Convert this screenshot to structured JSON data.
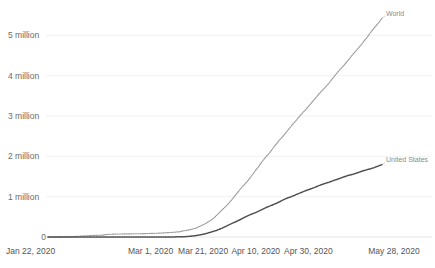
{
  "chart_data": {
    "type": "line",
    "title": "",
    "subtitle": "",
    "xlabel": "",
    "ylabel": "",
    "grid": true,
    "legend_position": "inline-end-of-line",
    "ylim": [
      0,
      5500000
    ],
    "yticks": [
      0,
      1000000,
      2000000,
      3000000,
      4000000,
      5000000
    ],
    "ytick_labels": [
      "0",
      "1 million",
      "2 million",
      "3 million",
      "4 million",
      "5 million"
    ],
    "xlim": [
      "Jan 22, 2020",
      "May 28, 2020"
    ],
    "xtick_labels": [
      "Jan 22, 2020",
      "Mar 1, 2020",
      "Mar 21, 2020",
      "Apr 10, 2020",
      "Apr 30, 2020",
      "May 28, 2020"
    ],
    "xtick_day_index": [
      0,
      39,
      59,
      79,
      99,
      127
    ],
    "x_day_count": 128,
    "series": [
      {
        "name": "World",
        "label": "World",
        "color": "#9a9a9a",
        "style": "dotted",
        "end_value": 5500000,
        "values": [
          555,
          654,
          941,
          1434,
          2118,
          2927,
          5578,
          6166,
          8234,
          9927,
          12038,
          16787,
          19881,
          23892,
          27635,
          30794,
          34391,
          37120,
          40150,
          42762,
          44802,
          45221,
          60368,
          66885,
          69030,
          71224,
          73258,
          75136,
          75639,
          76197,
          76823,
          78579,
          78965,
          79570,
          80413,
          81395,
          82754,
          84120,
          86011,
          88369,
          90306,
          92840,
          95120,
          97886,
          101801,
          105847,
          109821,
          113590,
          118620,
          125875,
          128343,
          145193,
          156097,
          167446,
          181527,
          197142,
          214910,
          242708,
          272166,
          304524,
          336004,
          378235,
          418045,
          467594,
          529591,
          593291,
          660706,
          720117,
          782365,
          857487,
          932605,
          1013466,
          1095917,
          1176897,
          1249754,
          1321481,
          1396475,
          1480203,
          1565593,
          1657526,
          1735650,
          1834721,
          1917320,
          1995983,
          2064115,
          2152437,
          2240191,
          2317758,
          2401378,
          2472259,
          2549123,
          2628894,
          2708420,
          2788860,
          2861669,
          2940689,
          3019221,
          3090445,
          3156510,
          3232219,
          3308316,
          3388289,
          3465610,
          3544222,
          3614901,
          3679499,
          3750837,
          3827346,
          3910738,
          3992957,
          4072147,
          4147855,
          4218212,
          4291172,
          4369640,
          4450387,
          4531972,
          4608001,
          4680177,
          4757278,
          4840147,
          4922141,
          5009772,
          5098569,
          5176994,
          5254204,
          5330509,
          5427428
        ]
      },
      {
        "name": "United States",
        "label": "United States",
        "color": "#4d4d4d",
        "style": "dotted",
        "end_value": 1460000,
        "values": [
          1,
          1,
          2,
          2,
          5,
          5,
          5,
          5,
          6,
          6,
          8,
          8,
          11,
          11,
          11,
          11,
          11,
          11,
          11,
          12,
          12,
          12,
          13,
          13,
          13,
          13,
          13,
          15,
          15,
          15,
          24,
          35,
          53,
          60,
          68,
          74,
          98,
          118,
          149,
          217,
          262,
          402,
          518,
          583,
          959,
          1281,
          1663,
          2179,
          2727,
          3499,
          4632,
          6421,
          7783,
          13677,
          19100,
          25489,
          33276,
          43847,
          53740,
          65778,
          83836,
          101657,
          121478,
          140909,
          161831,
          188172,
          213372,
          243762,
          275586,
          308853,
          337072,
          366614,
          396223,
          429052,
          461437,
          496535,
          526396,
          555313,
          580619,
          607670,
          636350,
          667801,
          699706,
          732197,
          759086,
          784326,
          811865,
          840476,
          869170,
          905358,
          938154,
          965785,
          988197,
          1012582,
          1039909,
          1069424,
          1095023,
          1122486,
          1148290,
          1171510,
          1193813,
          1219066,
          1245695,
          1272640,
          1296280,
          1319912,
          1340098,
          1361522,
          1384930,
          1409452,
          1429310,
          1452171,
          1477459,
          1500851,
          1521252,
          1539223,
          1556630,
          1577287,
          1599080,
          1622670,
          1643246,
          1662414,
          1680625,
          1699176,
          1719827,
          1745803,
          1768461,
          1793530
        ]
      }
    ]
  },
  "axis": {
    "ytick_labels": [
      "5 million",
      "4 million",
      "3 million",
      "2 million",
      "1 million",
      "0"
    ],
    "xtick_labels": [
      "Jan 22, 2020",
      "Mar 1, 2020",
      "Mar 21, 2020",
      "Apr 10, 2020",
      "Apr 30, 2020",
      "May 28, 2020"
    ]
  },
  "labels": {
    "world": "World",
    "united_states": "United States"
  },
  "colors": {
    "world_line": "#9a9a9a",
    "us_line": "#4d4d4d",
    "gridline": "#ededed",
    "axis_text": "#6b6b6b",
    "background": "#ffffff"
  }
}
